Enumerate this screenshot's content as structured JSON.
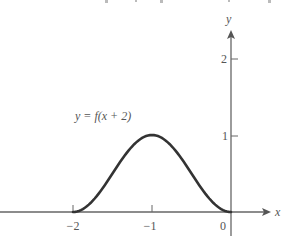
{
  "chart_data": {
    "type": "line",
    "title": "",
    "annotation": "y = f(x + 2)",
    "xlabel": "x",
    "ylabel": "y",
    "x_ticks": [
      -2,
      -1,
      0
    ],
    "x_tick_labels": [
      "−2",
      "−1",
      "0"
    ],
    "y_ticks": [
      1,
      2
    ],
    "y_tick_labels": [
      "1",
      "2"
    ],
    "xlim": [
      -2.9,
      0.5
    ],
    "ylim": [
      -0.4,
      2.4
    ],
    "grid": false,
    "legend": null,
    "series": [
      {
        "name": "y = f(x + 2)",
        "description": "smooth bump, zero at x=-2 and x=0, maximum 1 at x=-1",
        "x": [
          -2,
          -1.75,
          -1.5,
          -1.25,
          -1,
          -0.75,
          -0.5,
          -0.25,
          0
        ],
        "values": [
          0,
          0.15,
          0.5,
          0.85,
          1,
          0.85,
          0.5,
          0.15,
          0
        ]
      }
    ],
    "colors": {
      "curve": "#333333",
      "axes": "#666666",
      "text": "#555555"
    }
  },
  "labels": {
    "annotation": "y = f(x + 2)",
    "x_axis": "x",
    "y_axis": "y",
    "tick_x_neg2": "−2",
    "tick_x_neg1": "−1",
    "tick_x_0": "0",
    "tick_y_1": "1",
    "tick_y_2": "2"
  }
}
